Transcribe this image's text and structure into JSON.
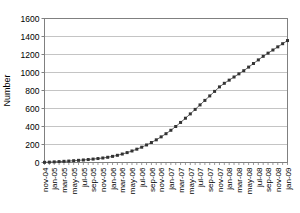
{
  "chart_data": {
    "type": "line",
    "title": "",
    "xlabel": "",
    "ylabel": "Number",
    "ylim": [
      0,
      1600
    ],
    "yticks": [
      0,
      200,
      400,
      600,
      800,
      1000,
      1200,
      1400,
      1600
    ],
    "grid": true,
    "legend": "none",
    "marker": "square",
    "line_color": "#555555",
    "marker_color": "#333333",
    "grid_color": "#b5b5b5",
    "axis_color": "#808080",
    "x": [
      "nov-04",
      "dec-04",
      "jan-05",
      "feb-05",
      "mar-05",
      "apr-05",
      "may-05",
      "jun-05",
      "jul-05",
      "aug-05",
      "sep-05",
      "oct-05",
      "nov-05",
      "dec-05",
      "jan-06",
      "feb-06",
      "mar-06",
      "apr-06",
      "may-06",
      "jun-06",
      "jul-06",
      "aug-06",
      "sep-06",
      "oct-06",
      "nov-06",
      "dec-06",
      "jan-07",
      "feb-07",
      "mar-07",
      "apr-07",
      "may-07",
      "jun-07",
      "jul-07",
      "aug-07",
      "sep-07",
      "oct-07",
      "nov-07",
      "dec-07",
      "jan-08",
      "feb-08",
      "mar-08",
      "apr-08",
      "may-08",
      "jun-08",
      "jul-08",
      "aug-08",
      "sep-08",
      "oct-08",
      "nov-08",
      "dec-08",
      "jan-09"
    ],
    "xtick_labels": [
      "nov-04",
      "jan-05",
      "mar-05",
      "may-05",
      "jul-05",
      "sep-05",
      "nov-05",
      "jan-06",
      "mar-06",
      "may-06",
      "jul-06",
      "sep-06",
      "nov-06",
      "jan-07",
      "mar-07",
      "may-07",
      "jul-07",
      "sep-07",
      "nov-07",
      "jan-08",
      "mar-08",
      "may-08",
      "jul-08",
      "sep-08",
      "nov-08",
      "jan-09"
    ],
    "values": [
      2,
      4,
      7,
      10,
      13,
      16,
      20,
      24,
      28,
      33,
      38,
      44,
      50,
      58,
      68,
      80,
      94,
      110,
      128,
      148,
      170,
      195,
      222,
      252,
      285,
      320,
      358,
      400,
      445,
      492,
      540,
      590,
      640,
      690,
      740,
      790,
      840,
      880,
      915,
      950,
      985,
      1020,
      1060,
      1100,
      1140,
      1180,
      1215,
      1250,
      1285,
      1320,
      1355
    ]
  }
}
